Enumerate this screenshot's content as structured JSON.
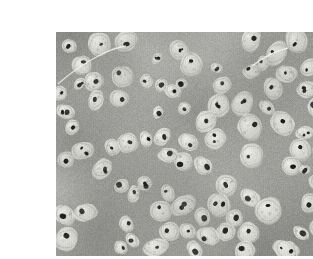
{
  "document": {
    "kind": "micrograph-plate",
    "background_color": "#ffffff",
    "page_width": 313,
    "page_height": 259
  },
  "figure": {
    "name": "hyaline-cartilage-micrograph",
    "alt_text": "Light micrograph of hyaline cartilage showing chondrocytes within lacunae embedded in a homogeneous extracellular matrix",
    "frame": {
      "left": 16,
      "top": 16,
      "width": 282,
      "height": 224
    },
    "staining": "haematoxylin and eosin, reproduced in greyscale",
    "palette": {
      "matrix_mid": "#9d9d99",
      "matrix_light": "#b2b2ad",
      "matrix_dark": "#7e7e7b",
      "lacuna_rim": "#f2f2ee",
      "cytoplasm": "#d8d8d2",
      "nucleus": "#17171a",
      "plate_border": "#8e8e8a"
    },
    "content": {
      "tissue": "hyaline cartilage",
      "primary_cells": "chondrocytes",
      "cell_compartment": "lacuna",
      "matrix_description": "smooth amorphous extracellular matrix",
      "nuclei_appearance": "small dense dark-stained nuclei",
      "isogenous_groups": "clusters of two to six chondrocytes"
    }
  },
  "artifacts": {
    "vertical_scan_striping": true,
    "right_margin_marks": 5
  }
}
